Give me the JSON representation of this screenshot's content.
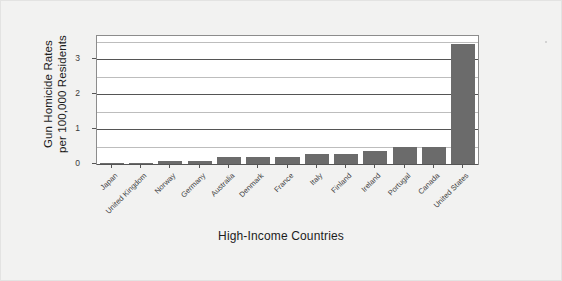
{
  "chart_data": {
    "type": "bar",
    "title": "",
    "xlabel": "High-Income Countries",
    "ylabel": "Gun Homicide Rates\nper 100,000 Residents",
    "ylabel_line1": "Gun Homicide Rates",
    "ylabel_line2": "per 100,000 Residents",
    "categories": [
      "Japan",
      "United Kingdom",
      "Norway",
      "Germany",
      "Australia",
      "Denmark",
      "France",
      "Italy",
      "Finland",
      "Ireland",
      "Portugal",
      "Canada",
      "United States"
    ],
    "values": [
      0.01,
      0.04,
      0.08,
      0.09,
      0.19,
      0.19,
      0.19,
      0.29,
      0.29,
      0.37,
      0.48,
      0.48,
      3.43
    ],
    "ylim": [
      0,
      3.66
    ],
    "ytick_labels": [
      "0",
      "1",
      "2",
      "3"
    ],
    "ytick_values": [
      0,
      1,
      2,
      3
    ],
    "minor_gridline_values": [
      0.5,
      1.5,
      2.5,
      3.5
    ],
    "grid": true,
    "legend": "none",
    "bar_color": "#6b6b6b",
    "plot_background": "#ffffff",
    "figure_background": "#f2f2f1",
    "axis_color": "#8c8c8c",
    "major_grid_color": "#555555",
    "minor_grid_color": "#bdbdbd"
  }
}
